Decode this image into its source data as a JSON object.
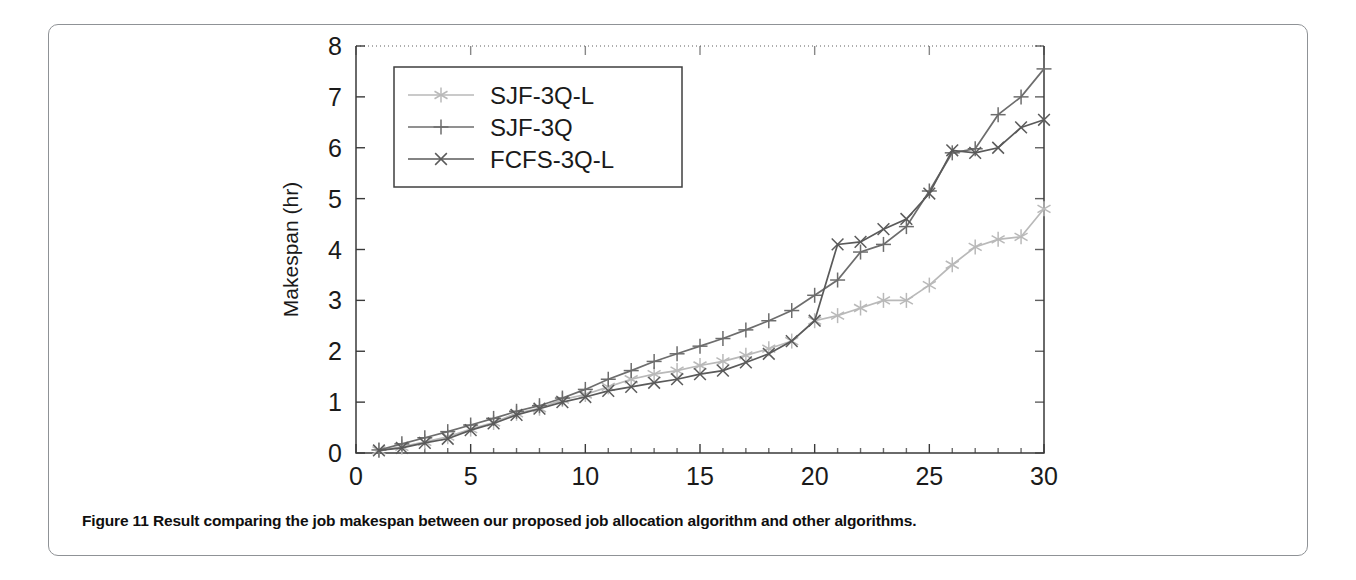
{
  "figure": {
    "number_label": "Figure 11",
    "caption_text": "Result comparing the job makespan between our proposed job allocation algorithm and other algorithms."
  },
  "colors": {
    "series_sjf3ql": "#b9b9b9",
    "series_sjf3q": "#6d6d6d",
    "series_fcfs3ql": "#5a5a5a",
    "axis": "#3a3a3a",
    "text": "#1a1a1a",
    "card_border": "#8f9296"
  },
  "chart_data": {
    "type": "line",
    "title": "",
    "xlabel": "Data processed (GB)",
    "ylabel": "Makespan (hr)",
    "xlim": [
      0,
      30
    ],
    "ylim": [
      0,
      8
    ],
    "xticks": [
      0,
      5,
      10,
      15,
      20,
      25,
      30
    ],
    "yticks": [
      0,
      1,
      2,
      3,
      4,
      5,
      6,
      7,
      8
    ],
    "xtick_labels": [
      "0",
      "5",
      "10",
      "15",
      "20",
      "25",
      "30"
    ],
    "ytick_labels": [
      "0",
      "1",
      "2",
      "3",
      "4",
      "5",
      "6",
      "7",
      "8"
    ],
    "grid": false,
    "legend_position": "upper left",
    "x": [
      1,
      2,
      3,
      4,
      5,
      6,
      7,
      8,
      9,
      10,
      11,
      12,
      13,
      14,
      15,
      16,
      17,
      18,
      19,
      20,
      21,
      22,
      23,
      24,
      25,
      26,
      27,
      28,
      29,
      30
    ],
    "series": [
      {
        "name": "SJF-3Q-L",
        "marker": "asterisk",
        "color": "#b9b9b9",
        "values": [
          0.05,
          0.12,
          0.22,
          0.32,
          0.47,
          0.6,
          0.78,
          0.88,
          1.05,
          1.15,
          1.3,
          1.45,
          1.55,
          1.62,
          1.72,
          1.8,
          1.92,
          2.05,
          2.2,
          2.6,
          2.7,
          2.85,
          3.0,
          3.0,
          3.3,
          3.7,
          4.05,
          4.2,
          4.25,
          4.8
        ]
      },
      {
        "name": "SJF-3Q",
        "marker": "plus",
        "color": "#6d6d6d",
        "values": [
          0.06,
          0.18,
          0.3,
          0.42,
          0.55,
          0.68,
          0.82,
          0.93,
          1.08,
          1.25,
          1.45,
          1.62,
          1.8,
          1.95,
          2.1,
          2.25,
          2.42,
          2.6,
          2.8,
          3.1,
          3.4,
          3.95,
          4.1,
          4.45,
          5.15,
          5.9,
          5.98,
          6.65,
          7.0,
          7.55
        ]
      },
      {
        "name": "FCFS-3Q-L",
        "marker": "cross",
        "color": "#5a5a5a",
        "values": [
          0.05,
          0.1,
          0.2,
          0.28,
          0.45,
          0.58,
          0.75,
          0.87,
          1.0,
          1.1,
          1.22,
          1.3,
          1.38,
          1.45,
          1.55,
          1.62,
          1.78,
          1.95,
          2.2,
          2.6,
          4.1,
          4.15,
          4.4,
          4.6,
          5.1,
          5.95,
          5.9,
          6.0,
          6.4,
          6.55
        ]
      }
    ]
  },
  "legend": {
    "entries": [
      {
        "label": "SJF-3Q-L"
      },
      {
        "label": "SJF-3Q"
      },
      {
        "label": "FCFS-3Q-L"
      }
    ]
  }
}
